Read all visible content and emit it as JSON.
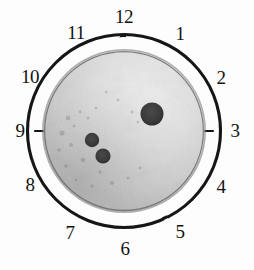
{
  "figure": {
    "kind": "clock-dial-specimen-photo",
    "caption": "",
    "background_color": "#fdfdfd",
    "ink_color": "#121212"
  },
  "dial": {
    "center_x": 124,
    "center_y": 131,
    "outer_ring_radius": 97,
    "outer_ring_stroke_width": 3,
    "outer_ring_color": "#141414",
    "disc_radius": 81,
    "disc_rim_color": "#6e6e6e",
    "disc_rim_width": 4,
    "disc_fill_light": "#ebebeb",
    "disc_fill_mid": "#c9c9c9",
    "disc_fill_dark": "#8f8f8f",
    "tick_color": "#141414",
    "tick_length": 10,
    "tick_stroke_width": 2,
    "label_radius": 112,
    "hours": [
      {
        "label": "12",
        "angle_deg": 0,
        "label_x": 124,
        "label_y": 16
      },
      {
        "label": "1",
        "angle_deg": 30,
        "label_x": 180,
        "label_y": 33
      },
      {
        "label": "2",
        "angle_deg": 60,
        "label_x": 221,
        "label_y": 77
      },
      {
        "label": "3",
        "angle_deg": 90,
        "label_x": 235,
        "label_y": 130
      },
      {
        "label": "4",
        "angle_deg": 120,
        "label_x": 221,
        "label_y": 186
      },
      {
        "label": "5",
        "angle_deg": 150,
        "label_x": 180,
        "label_y": 231
      },
      {
        "label": "6",
        "angle_deg": 180,
        "label_x": 125,
        "label_y": 248
      },
      {
        "label": "7",
        "angle_deg": 210,
        "label_x": 70,
        "label_y": 232
      },
      {
        "label": "8",
        "angle_deg": 240,
        "label_x": 30,
        "label_y": 184
      },
      {
        "label": "9",
        "angle_deg": 270,
        "label_x": 20,
        "label_y": 130
      },
      {
        "label": "10",
        "angle_deg": 300,
        "label_x": 30,
        "label_y": 76
      },
      {
        "label": "11",
        "angle_deg": 330,
        "label_x": 76,
        "label_y": 32
      }
    ]
  },
  "spots": [
    {
      "name": "spot-large",
      "cx": 152,
      "cy": 114,
      "r": 11.5,
      "color": "#3b3b3b",
      "clock_position": "between 1 and 2"
    },
    {
      "name": "spot-small-upper",
      "cx": 92,
      "cy": 140,
      "r": 7.2,
      "color": "#4a4a4a",
      "clock_position": "near 9 inner"
    },
    {
      "name": "spot-small-lower",
      "cx": 103,
      "cy": 156,
      "r": 7.6,
      "color": "#4a4a4a",
      "clock_position": "near 8 inner"
    }
  ]
}
